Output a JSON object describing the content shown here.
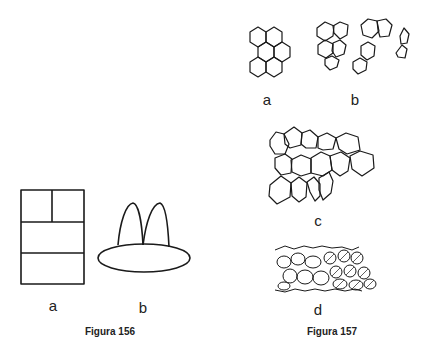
{
  "figure_156": {
    "caption": "Figura 156",
    "panels": [
      {
        "label": "a",
        "description": "rectangle divided into cells (two on top, two stacked below)"
      },
      {
        "label": "b",
        "description": "ellipse with two arch-shaped lobes on top"
      }
    ]
  },
  "figure_157": {
    "caption": "Figura 157",
    "panels": [
      {
        "label": "a",
        "description": "regular hexagonal cell cluster"
      },
      {
        "label": "b",
        "description": "irregular polygonal cell groups"
      },
      {
        "label": "c",
        "description": "sheet of polygonal cells"
      },
      {
        "label": "d",
        "description": "dense tissue with partially hatched cells"
      }
    ]
  },
  "colors": {
    "stroke": "#1a1a1a",
    "background": "#ffffff"
  }
}
